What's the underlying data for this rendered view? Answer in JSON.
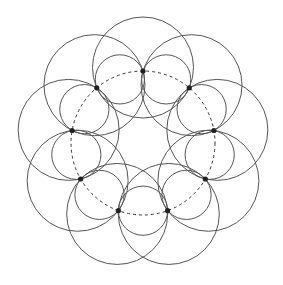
{
  "diagram": {
    "type": "geometric-circle-pattern",
    "center": [
      143,
      143
    ],
    "guide_circle": {
      "radius": 72,
      "style": "dashed",
      "color": "#333333"
    },
    "points": {
      "count": 9,
      "start_angle_deg": -90,
      "radius": 2.6,
      "color": "#222222"
    },
    "small_circles": {
      "count": 9,
      "description": "circle through each pair of adjacent points",
      "center_distance": 67.7,
      "radius": 24.6
    },
    "large_circles": {
      "count": 9,
      "description": "circle through points two steps apart",
      "center_distance": 75.5,
      "radius": 50.5
    },
    "stroke_color": "#555555",
    "background": "#ffffff"
  }
}
